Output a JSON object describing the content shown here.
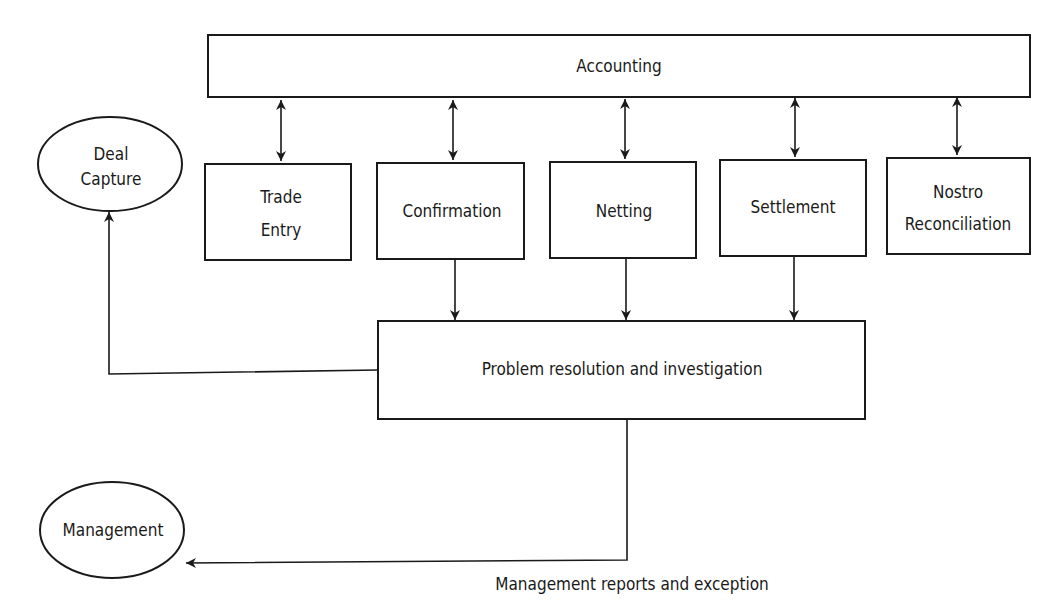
{
  "nodes": {
    "accounting": "Accounting",
    "deal_capture": [
      "Deal",
      "Capture"
    ],
    "trade_entry": [
      "Trade",
      "Entry"
    ],
    "confirmation": "Confirmation",
    "netting": "Netting",
    "settlement": "Settlement",
    "nostro": [
      "Nostro",
      "Reconciliation"
    ],
    "problem": "Problem resolution and investigation",
    "management": "Management"
  },
  "edge_labels": {
    "mgmt_reports": "Management reports and exception"
  },
  "colors": {
    "stroke": "#1a1a1a",
    "background": "#ffffff"
  }
}
